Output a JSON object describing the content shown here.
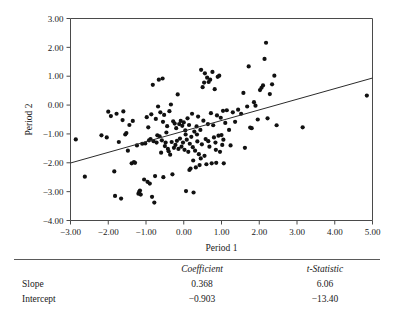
{
  "chart_data": {
    "type": "scatter",
    "title": "",
    "xlabel": "Period 1",
    "ylabel": "Period 2",
    "xlim": [
      -3.0,
      5.0
    ],
    "ylim": [
      -4.0,
      3.0
    ],
    "xticks": [
      "−3.00",
      "−2.00",
      "−1.00",
      "0.00",
      "1.00",
      "2.00",
      "3.00",
      "4.00",
      "5.00"
    ],
    "xtick_values": [
      -3,
      -2,
      -1,
      0,
      1,
      2,
      3,
      4,
      5
    ],
    "yticks": [
      "3.00",
      "2.00",
      "1.00",
      "0.00",
      "−1.00",
      "−2.00",
      "−3.00",
      "−4.00"
    ],
    "ytick_values": [
      3,
      2,
      1,
      0,
      -1,
      -2,
      -3,
      -4
    ],
    "grid": false,
    "legend": "none",
    "marker": "filled-circle",
    "marker_color": "#111111",
    "fit_line": {
      "slope": 0.368,
      "intercept": -0.903,
      "x_start": -3.0,
      "x_end": 5.0,
      "y_start": -2.007,
      "y_end": 0.937,
      "color": "#2b2b2b"
    },
    "points": [
      [
        -2.86,
        -1.19
      ],
      [
        -2.62,
        -2.48
      ],
      [
        -2.18,
        -1.05
      ],
      [
        -2.04,
        -1.12
      ],
      [
        -2.0,
        -0.23
      ],
      [
        -1.93,
        -0.38
      ],
      [
        -1.84,
        -2.3
      ],
      [
        -1.82,
        -3.15
      ],
      [
        -1.78,
        -0.3
      ],
      [
        -1.72,
        -1.28
      ],
      [
        -1.66,
        -3.24
      ],
      [
        -1.6,
        -0.22
      ],
      [
        -1.55,
        -1.02
      ],
      [
        -1.52,
        -0.97
      ],
      [
        -1.48,
        -1.58
      ],
      [
        -1.44,
        -0.69
      ],
      [
        -1.38,
        -2.02
      ],
      [
        -1.32,
        -1.98
      ],
      [
        -1.29,
        -2.0
      ],
      [
        -1.24,
        -1.4
      ],
      [
        -1.2,
        -3.07
      ],
      [
        -1.18,
        -3.01
      ],
      [
        -1.16,
        -2.96
      ],
      [
        -1.14,
        -3.1
      ],
      [
        -1.1,
        -1.34
      ],
      [
        -1.05,
        -2.58
      ],
      [
        -1.02,
        -1.33
      ],
      [
        -0.98,
        -0.42
      ],
      [
        -0.96,
        -2.66
      ],
      [
        -0.94,
        -0.77
      ],
      [
        -0.92,
        -1.22
      ],
      [
        -0.9,
        -2.72
      ],
      [
        -0.88,
        -1.18
      ],
      [
        -0.86,
        -0.32
      ],
      [
        -0.84,
        -3.18
      ],
      [
        -0.82,
        0.7
      ],
      [
        -0.8,
        -1.25
      ],
      [
        -0.78,
        -3.38
      ],
      [
        -0.76,
        -2.46
      ],
      [
        -0.74,
        -0.48
      ],
      [
        -0.72,
        -1.3
      ],
      [
        -0.7,
        -1.05
      ],
      [
        -0.66,
        0.88
      ],
      [
        -0.62,
        -0.25
      ],
      [
        -0.6,
        -1.65
      ],
      [
        -0.58,
        -1.22
      ],
      [
        -0.56,
        0.92
      ],
      [
        -0.54,
        -2.5
      ],
      [
        -0.52,
        -0.34
      ],
      [
        -0.5,
        -1.42
      ],
      [
        -0.48,
        -1.3
      ],
      [
        -0.44,
        -0.73
      ],
      [
        -0.42,
        -1.52
      ],
      [
        -0.4,
        -1.6
      ],
      [
        -0.38,
        -0.21
      ],
      [
        -0.34,
        0.02
      ],
      [
        -0.32,
        -1.28
      ],
      [
        -0.3,
        -2.4
      ],
      [
        -0.28,
        -0.56
      ],
      [
        -0.26,
        -1.48
      ],
      [
        -0.24,
        -0.64
      ],
      [
        -0.22,
        -1.38
      ],
      [
        -0.2,
        -0.8
      ],
      [
        -0.18,
        -1.24
      ],
      [
        -0.16,
        0.37
      ],
      [
        -0.14,
        -1.52
      ],
      [
        -0.12,
        -0.66
      ],
      [
        -0.1,
        -1.16
      ],
      [
        -0.08,
        -0.55
      ],
      [
        -0.06,
        -1.44
      ],
      [
        -0.04,
        -0.72
      ],
      [
        -0.02,
        -1.3
      ],
      [
        0.0,
        -0.6
      ],
      [
        0.02,
        -1.55
      ],
      [
        0.04,
        -0.88
      ],
      [
        0.06,
        -2.98
      ],
      [
        0.08,
        -1.2
      ],
      [
        0.1,
        -0.46
      ],
      [
        0.12,
        -1.62
      ],
      [
        0.14,
        -0.69
      ],
      [
        0.16,
        -1.34
      ],
      [
        0.18,
        -2.2
      ],
      [
        0.2,
        -1.1
      ],
      [
        0.22,
        -0.3
      ],
      [
        0.24,
        -1.46
      ],
      [
        0.26,
        -3.03
      ],
      [
        0.28,
        -0.92
      ],
      [
        0.3,
        -1.58
      ],
      [
        0.32,
        -2.16
      ],
      [
        0.34,
        -0.74
      ],
      [
        0.36,
        -1.26
      ],
      [
        0.38,
        -0.4
      ],
      [
        0.4,
        -1.7
      ],
      [
        0.42,
        -2.08
      ],
      [
        0.44,
        -0.86
      ],
      [
        0.46,
        1.22
      ],
      [
        0.48,
        -1.36
      ],
      [
        0.5,
        0.62
      ],
      [
        0.52,
        -0.54
      ],
      [
        0.54,
        0.78
      ],
      [
        0.56,
        1.1
      ],
      [
        0.58,
        -1.18
      ],
      [
        0.6,
        -2.05
      ],
      [
        0.62,
        0.95
      ],
      [
        0.64,
        -0.66
      ],
      [
        0.66,
        0.8
      ],
      [
        0.68,
        -1.44
      ],
      [
        0.7,
        0.88
      ],
      [
        0.72,
        -0.28
      ],
      [
        0.74,
        -2.02
      ],
      [
        0.76,
        1.15
      ],
      [
        0.78,
        -0.7
      ],
      [
        0.8,
        -1.12
      ],
      [
        0.82,
        0.55
      ],
      [
        0.84,
        -1.3
      ],
      [
        0.86,
        -2.0
      ],
      [
        0.88,
        -0.36
      ],
      [
        0.9,
        0.98
      ],
      [
        0.92,
        -1.06
      ],
      [
        0.94,
        1.02
      ],
      [
        0.96,
        -1.62
      ],
      [
        0.98,
        -0.44
      ],
      [
        1.0,
        -1.04
      ],
      [
        1.02,
        -1.38
      ],
      [
        1.04,
        -0.2
      ],
      [
        1.06,
        -2.02
      ],
      [
        1.1,
        -0.62
      ],
      [
        1.14,
        -0.18
      ],
      [
        1.2,
        -0.86
      ],
      [
        1.24,
        -1.4
      ],
      [
        1.3,
        -0.25
      ],
      [
        1.36,
        -0.58
      ],
      [
        1.44,
        -0.16
      ],
      [
        1.52,
        -0.3
      ],
      [
        1.58,
        0.42
      ],
      [
        1.62,
        -1.48
      ],
      [
        1.68,
        -0.05
      ],
      [
        1.72,
        1.34
      ],
      [
        1.76,
        -0.78
      ],
      [
        1.8,
        -0.8
      ],
      [
        1.86,
        0.1
      ],
      [
        1.9,
        -0.02
      ],
      [
        1.96,
        -0.5
      ],
      [
        2.02,
        0.52
      ],
      [
        2.06,
        0.6
      ],
      [
        2.1,
        0.68
      ],
      [
        2.14,
        1.6
      ],
      [
        2.18,
        2.16
      ],
      [
        2.22,
        -0.46
      ],
      [
        2.28,
        0.38
      ],
      [
        2.34,
        0.72
      ],
      [
        2.4,
        1.02
      ],
      [
        2.46,
        -0.7
      ],
      [
        3.15,
        -0.77
      ],
      [
        4.85,
        0.33
      ],
      [
        -0.64,
        -1.08
      ],
      [
        -0.46,
        -0.95
      ],
      [
        0.05,
        -1.02
      ],
      [
        0.35,
        -1.02
      ],
      [
        0.65,
        -1.25
      ],
      [
        0.45,
        -1.85
      ],
      [
        0.25,
        -1.92
      ],
      [
        0.55,
        -1.76
      ],
      [
        0.15,
        -2.25
      ],
      [
        -0.36,
        -1.72
      ],
      [
        -0.55,
        -0.58
      ],
      [
        -1.35,
        -0.55
      ],
      [
        -1.62,
        -0.52
      ],
      [
        -0.68,
        -0.05
      ],
      [
        0.85,
        -1.55
      ],
      [
        1.05,
        -1.2
      ]
    ]
  },
  "stats_table": {
    "columns": [
      "",
      "Coefficient",
      "t-Statistic"
    ],
    "rows": [
      {
        "label": "Slope",
        "coefficient": "0.368",
        "t_statistic": "6.06"
      },
      {
        "label": "Intercept",
        "coefficient": "−0.903",
        "t_statistic": "−13.40"
      }
    ]
  }
}
